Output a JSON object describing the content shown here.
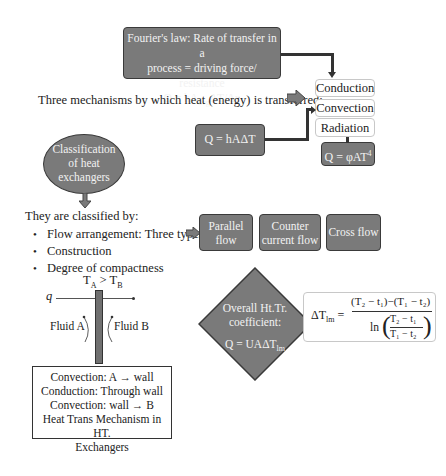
{
  "fourier": {
    "line1": "Fourier's law: Rate of transfer in a",
    "line2": "process = driving force/ resistance",
    "eq_q": "Q = kA",
    "eq_sub": "avg",
    "eq_rest": "ΔT/Δx"
  },
  "mechanisms": {
    "intro": "Three mechanisms by which heat (energy) is transferred:",
    "items": [
      "Conduction",
      "Convection",
      "Radiation"
    ],
    "convection_eq": "Q = hAΔT",
    "radiation_eq": "Q = φAT",
    "radiation_sup": "4"
  },
  "classification": {
    "oval_label_1": "Classification",
    "oval_label_2": "of heat",
    "oval_label_3": "exchangers",
    "intro": "They are classified  by:",
    "bullets": [
      "Flow arrangement: Three types",
      "Construction",
      "Degree of compactness"
    ],
    "flow_types": [
      {
        "line1": "Parallel",
        "line2": "flow"
      },
      {
        "line1": "Counter",
        "line2": "current flow"
      },
      {
        "line1": "Cross flow",
        "line2": ""
      }
    ]
  },
  "wall_diagram": {
    "temp_TA": "T",
    "temp_A_sub": "A",
    "temp_gt": " > T",
    "temp_B_sub": "B",
    "q_label": "q",
    "fluid_a": "Fluid A",
    "fluid_b": "Fluid B"
  },
  "mechanism_box": {
    "line1": "Convection: A → wall",
    "line2": "Conduction: Through wall",
    "line3": "Convection: wall → B",
    "line4": "Heat Trans Mechanism in HT.",
    "line5": "Exchangers"
  },
  "overall": {
    "line1": "Overall Ht.Tr.",
    "line2": "coefficient:",
    "eq": "Q = UAΔT",
    "eq_sub": "lm"
  },
  "lmtd": {
    "lhs": "ΔT",
    "lhs_sub": "lm",
    "numerator": "(T₂ − t₁)−(T₁ − t₂)",
    "ln": "ln",
    "frac_num": "T₂ − t₁",
    "frac_den": "T₁ − t₂"
  },
  "colors": {
    "box_gray": "#7a7a7a",
    "box_border": "#3a3a3a",
    "text": "#222222",
    "white_box_border": "#c8c8c8"
  }
}
